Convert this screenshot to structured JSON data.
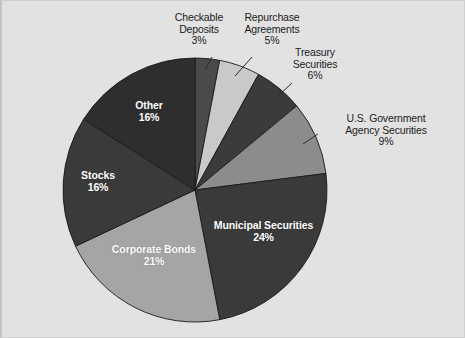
{
  "figure": {
    "background_color": "#e2e2e2",
    "border_color": "#cfcfcf",
    "width": 465,
    "height": 338
  },
  "chart_data": {
    "type": "pie",
    "title": "",
    "subtitle": "",
    "xlabel": "",
    "ylabel": "",
    "legend_position": "none",
    "grid": false,
    "start_angle_deg": 0,
    "direction": "clockwise",
    "center": {
      "x": 195,
      "y": 190
    },
    "radius": 132,
    "categories": [
      "Checkable Deposits",
      "Repurchase Agreements",
      "Treasury Securities",
      "U.S. Government Agency Securities",
      "Municipal Securities",
      "Corporate Bonds",
      "Stocks",
      "Other"
    ],
    "values": [
      3,
      5,
      6,
      9,
      24,
      21,
      16,
      16
    ],
    "value_labels": [
      "3%",
      "5%",
      "6%",
      "9%",
      "24%",
      "21%",
      "16%",
      "16%"
    ],
    "colors": [
      "#4a4a4a",
      "#c9c9c9",
      "#3b3b3b",
      "#8c8c8c",
      "#3a3a3a",
      "#a5a5a5",
      "#3a3a3a",
      "#2e2e2e"
    ],
    "slice_label_placement": [
      "outside",
      "outside",
      "outside",
      "outside",
      "inside",
      "inside",
      "inside",
      "inside"
    ],
    "slices": [
      {
        "name": "Checkable Deposits",
        "value": 3,
        "value_label": "3%",
        "color": "#4a4a4a",
        "placement": "outside"
      },
      {
        "name": "Repurchase Agreements",
        "value": 5,
        "value_label": "5%",
        "color": "#c9c9c9",
        "placement": "outside"
      },
      {
        "name": "Treasury Securities",
        "value": 6,
        "value_label": "6%",
        "color": "#3b3b3b",
        "placement": "outside"
      },
      {
        "name": "U.S. Government Agency Securities",
        "value": 9,
        "value_label": "9%",
        "color": "#8c8c8c",
        "placement": "outside"
      },
      {
        "name": "Municipal Securities",
        "value": 24,
        "value_label": "24%",
        "color": "#3a3a3a",
        "placement": "inside"
      },
      {
        "name": "Corporate Bonds",
        "value": 21,
        "value_label": "21%",
        "color": "#a5a5a5",
        "placement": "inside"
      },
      {
        "name": "Stocks",
        "value": 16,
        "value_label": "16%",
        "color": "#3a3a3a",
        "placement": "inside"
      },
      {
        "name": "Other",
        "value": 16,
        "value_label": "16%",
        "color": "#2e2e2e",
        "placement": "inside"
      }
    ]
  },
  "callouts": {
    "checkable_deposits": "Checkable\nDeposits\n3%",
    "repurchase_agreements": "Repurchase\nAgreements\n5%",
    "treasury_securities": "Treasury\nSecurities\n6%",
    "us_government_agency_securities": "U.S. Government\nAgency Securities\n9%"
  },
  "slice_labels": {
    "other": "Other\n16%",
    "stocks": "Stocks\n16%",
    "corporate_bonds": "Corporate Bonds\n21%",
    "municipal_securities": "Municipal Securities\n24%"
  }
}
